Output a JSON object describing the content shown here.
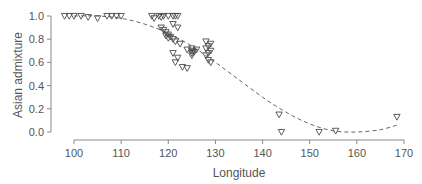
{
  "chart_data": {
    "type": "scatter",
    "title": "",
    "xlabel": "Longitude",
    "ylabel": "Asian admixture",
    "xlim": [
      96,
      171
    ],
    "ylim": [
      0.0,
      1.0
    ],
    "x_ticks": [
      100,
      110,
      120,
      130,
      140,
      150,
      160,
      170
    ],
    "y_ticks": [
      0.0,
      0.2,
      0.4,
      0.6,
      0.8,
      1.0
    ],
    "x_tick_labels": [
      "100",
      "110",
      "120",
      "130",
      "140",
      "150",
      "160",
      "170"
    ],
    "y_tick_labels": [
      "0.0",
      "0.2",
      "0.4",
      "0.6",
      "0.8",
      "1.0"
    ],
    "grid": false,
    "marker": "open-down-triangle",
    "series": [
      {
        "name": "samples",
        "points": [
          [
            98.0,
            1.0
          ],
          [
            99.0,
            1.0
          ],
          [
            100.0,
            1.0
          ],
          [
            101.5,
            1.0
          ],
          [
            103.0,
            0.99
          ],
          [
            105.0,
            0.98
          ],
          [
            107.0,
            1.0
          ],
          [
            108.0,
            1.0
          ],
          [
            109.0,
            1.0
          ],
          [
            110.0,
            1.0
          ],
          [
            116.5,
            1.0
          ],
          [
            117.0,
            0.98
          ],
          [
            118.0,
            1.0
          ],
          [
            118.5,
            0.99
          ],
          [
            119.0,
            1.0
          ],
          [
            120.0,
            1.0
          ],
          [
            121.0,
            1.0
          ],
          [
            121.5,
            1.0
          ],
          [
            122.0,
            1.0
          ],
          [
            118.5,
            0.9
          ],
          [
            119.0,
            0.88
          ],
          [
            119.5,
            0.86
          ],
          [
            120.0,
            0.84
          ],
          [
            120.5,
            0.82
          ],
          [
            121.0,
            0.8
          ],
          [
            121.5,
            0.78
          ],
          [
            122.0,
            0.9
          ],
          [
            121.0,
            0.93
          ],
          [
            119.5,
            0.83
          ],
          [
            120.0,
            0.81
          ],
          [
            122.5,
            0.76
          ],
          [
            121.0,
            0.68
          ],
          [
            122.0,
            0.64
          ],
          [
            121.5,
            0.6
          ],
          [
            123.0,
            0.56
          ],
          [
            124.0,
            0.55
          ],
          [
            125.0,
            0.72
          ],
          [
            125.0,
            0.7
          ],
          [
            125.0,
            0.68
          ],
          [
            125.0,
            0.66
          ],
          [
            125.5,
            0.69
          ],
          [
            126.0,
            0.71
          ],
          [
            124.0,
            0.71
          ],
          [
            128.0,
            0.78
          ],
          [
            129.0,
            0.76
          ],
          [
            128.5,
            0.74
          ],
          [
            128.0,
            0.72
          ],
          [
            129.0,
            0.7
          ],
          [
            128.5,
            0.68
          ],
          [
            128.0,
            0.66
          ],
          [
            128.5,
            0.62
          ],
          [
            129.0,
            0.6
          ],
          [
            143.5,
            0.15
          ],
          [
            144.0,
            0.0
          ],
          [
            152.0,
            0.0
          ],
          [
            155.5,
            0.01
          ],
          [
            168.5,
            0.13
          ]
        ]
      }
    ],
    "fit_curve": {
      "name": "fitted cline",
      "style": "dashed",
      "points": [
        [
          100,
          1.0
        ],
        [
          105,
          1.0
        ],
        [
          110,
          0.98
        ],
        [
          115,
          0.93
        ],
        [
          120,
          0.85
        ],
        [
          125,
          0.74
        ],
        [
          130,
          0.6
        ],
        [
          135,
          0.45
        ],
        [
          140,
          0.3
        ],
        [
          145,
          0.17
        ],
        [
          150,
          0.07
        ],
        [
          155,
          0.01
        ],
        [
          160,
          0.0
        ],
        [
          165,
          0.02
        ],
        [
          168.5,
          0.06
        ]
      ]
    },
    "legend": "none"
  }
}
